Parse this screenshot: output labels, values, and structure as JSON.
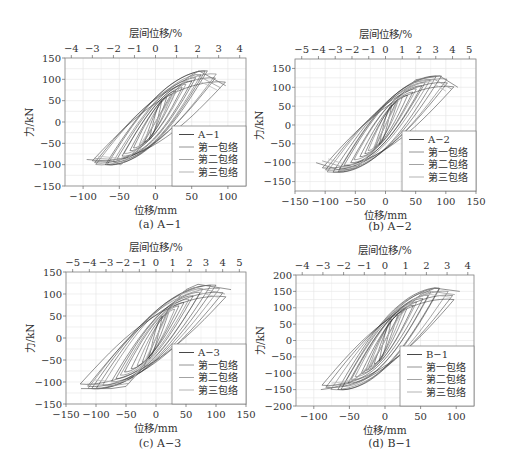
{
  "figure": {
    "panels": [
      {
        "id": "a",
        "caption": "(a) A−1",
        "top_axis_label": "层间位移/%",
        "bottom_axis_label": "位移/mm",
        "y_axis_label": "力/kN",
        "legend": [
          "A−1",
          "第一包络",
          "第二包络",
          "第三包络"
        ]
      },
      {
        "id": "b",
        "caption": "(b) A−2",
        "top_axis_label": "层间位移/%",
        "bottom_axis_label": "位移/mm",
        "y_axis_label": "力/kN",
        "legend": [
          "A−2",
          "第一包络",
          "第二包络",
          "第三包络"
        ]
      },
      {
        "id": "c",
        "caption": "(c) A−3",
        "top_axis_label": "层间位移/%",
        "bottom_axis_label": "位移/mm",
        "y_axis_label": "力/kN",
        "legend": [
          "A−3",
          "第一包络",
          "第二包络",
          "第三包络"
        ]
      },
      {
        "id": "d",
        "caption": "(d) B−1",
        "top_axis_label": "层间位移/%",
        "bottom_axis_label": "位移/mm",
        "y_axis_label": "力/kN",
        "legend": [
          "B−1",
          "第一包络",
          "第二包络",
          "第三包络"
        ]
      }
    ]
  },
  "chart_data": [
    {
      "type": "line",
      "title": "(a) A−1",
      "xlabel": "位移/mm",
      "x2label": "层间位移/%",
      "ylabel": "力/kN",
      "xlim": [
        -125,
        125
      ],
      "ylim": [
        -150,
        150
      ],
      "xticks": [
        -100,
        -50,
        0,
        50,
        100
      ],
      "x2ticks": [
        -4,
        -3,
        -2,
        -1,
        0,
        1,
        2,
        3,
        4
      ],
      "x2lim": [
        -4.3,
        4.3
      ],
      "yticks": [
        -150,
        -100,
        -50,
        0,
        50,
        100,
        150
      ],
      "grid": true,
      "legend_position": "lower right",
      "legend": [
        "A−1",
        "第一包络",
        "第二包络",
        "第三包络"
      ],
      "peaks": {
        "pos_disp": 97,
        "pos_force": 120,
        "neg_disp": -95,
        "neg_force": -100
      },
      "series": [
        {
          "name": "A−1",
          "style": "hysteresis",
          "color": "#222222"
        },
        {
          "name": "第一包络",
          "color": "#777777",
          "x": [
            -95,
            -60,
            -48,
            -20,
            0,
            20,
            45,
            60,
            97
          ],
          "y": [
            -88,
            -92,
            -100,
            -60,
            0,
            60,
            105,
            120,
            85
          ]
        },
        {
          "name": "第二包络",
          "color": "#999999",
          "x": [
            -85,
            -55,
            -45,
            -20,
            0,
            20,
            45,
            55,
            90
          ],
          "y": [
            -85,
            -88,
            -95,
            -55,
            0,
            55,
            100,
            112,
            80
          ]
        },
        {
          "name": "第三包络",
          "color": "#bbbbbb",
          "x": [
            -80,
            -50,
            -40,
            -20,
            0,
            20,
            40,
            50,
            85
          ],
          "y": [
            -80,
            -85,
            -90,
            -50,
            0,
            50,
            95,
            105,
            75
          ]
        }
      ]
    },
    {
      "type": "line",
      "title": "(b) A−2",
      "xlabel": "位移/mm",
      "x2label": "层间位移/%",
      "ylabel": "力/kN",
      "xlim": [
        -150,
        150
      ],
      "ylim": [
        -175,
        175
      ],
      "xticks": [
        -150,
        -100,
        -50,
        0,
        50,
        100,
        150
      ],
      "x2ticks": [
        -5,
        -4,
        -3,
        -2,
        -1,
        0,
        1,
        2,
        3,
        4,
        5
      ],
      "x2lim": [
        -5.4,
        5.4
      ],
      "yticks": [
        -150,
        -100,
        -50,
        0,
        50,
        100,
        150
      ],
      "grid": true,
      "legend_position": "lower right",
      "legend": [
        "A−2",
        "第一包络",
        "第二包络",
        "第三包络"
      ],
      "peaks": {
        "pos_disp": 120,
        "pos_force": 130,
        "neg_disp": -115,
        "neg_force": -125
      },
      "series": [
        {
          "name": "A−2",
          "style": "hysteresis",
          "color": "#222222"
        },
        {
          "name": "第一包络",
          "color": "#777777",
          "x": [
            -115,
            -75,
            -50,
            -20,
            0,
            20,
            50,
            90,
            120
          ],
          "y": [
            -100,
            -120,
            -115,
            -70,
            0,
            70,
            120,
            130,
            100
          ]
        },
        {
          "name": "第二包络",
          "color": "#999999",
          "x": [
            -105,
            -70,
            -45,
            -20,
            0,
            20,
            45,
            80,
            110
          ],
          "y": [
            -95,
            -112,
            -110,
            -65,
            0,
            65,
            112,
            122,
            95
          ]
        },
        {
          "name": "第三包络",
          "color": "#bbbbbb",
          "x": [
            -95,
            -65,
            -40,
            -20,
            0,
            20,
            40,
            75,
            100
          ],
          "y": [
            -90,
            -105,
            -103,
            -60,
            0,
            60,
            105,
            115,
            90
          ]
        }
      ]
    },
    {
      "type": "line",
      "title": "(c) A−3",
      "xlabel": "位移/mm",
      "x2label": "层间位移/%",
      "ylabel": "力/kN",
      "xlim": [
        -150,
        150
      ],
      "ylim": [
        -150,
        150
      ],
      "xticks": [
        -150,
        -100,
        -50,
        0,
        50,
        100,
        150
      ],
      "x2ticks": [
        -5,
        -4,
        -3,
        -2,
        -1,
        0,
        1,
        2,
        3,
        4,
        5
      ],
      "x2lim": [
        -5.4,
        5.4
      ],
      "yticks": [
        -150,
        -100,
        -50,
        0,
        50,
        100,
        150
      ],
      "grid": true,
      "legend_position": "lower right",
      "legend": [
        "A−3",
        "第一包络",
        "第二包络",
        "第三包络"
      ],
      "peaks": {
        "pos_disp": 125,
        "pos_force": 120,
        "neg_disp": -135,
        "neg_force": -115
      },
      "series": [
        {
          "name": "A−3",
          "style": "hysteresis",
          "color": "#222222"
        },
        {
          "name": "第一包络",
          "color": "#777777",
          "x": [
            -125,
            -75,
            -50,
            -20,
            0,
            20,
            50,
            70,
            125
          ],
          "y": [
            -115,
            -115,
            -110,
            -65,
            0,
            65,
            110,
            122,
            110
          ]
        },
        {
          "name": "第二包络",
          "color": "#999999",
          "x": [
            -115,
            -70,
            -45,
            -20,
            0,
            20,
            45,
            65,
            115
          ],
          "y": [
            -105,
            -108,
            -103,
            -60,
            0,
            60,
            105,
            115,
            100
          ]
        },
        {
          "name": "第三包络",
          "color": "#bbbbbb",
          "x": [
            -105,
            -65,
            -40,
            -20,
            0,
            20,
            40,
            60,
            105
          ],
          "y": [
            -95,
            -100,
            -95,
            -55,
            0,
            55,
            98,
            108,
            92
          ]
        }
      ]
    },
    {
      "type": "line",
      "title": "(d) B−1",
      "xlabel": "位移/mm",
      "x2label": "层间位移/%",
      "ylabel": "力/kN",
      "xlim": [
        -125,
        125
      ],
      "ylim": [
        -200,
        200
      ],
      "xticks": [
        -100,
        -50,
        0,
        50,
        100
      ],
      "x2ticks": [
        -4,
        -3,
        -2,
        -1,
        0,
        1,
        2,
        3,
        4
      ],
      "x2lim": [
        -4.3,
        4.3
      ],
      "yticks": [
        -200,
        -150,
        -100,
        -50,
        0,
        50,
        100,
        150,
        200
      ],
      "grid": true,
      "legend_position": "lower right",
      "legend": [
        "B−1",
        "第一包络",
        "第二包络",
        "第三包络"
      ],
      "peaks": {
        "pos_disp": 105,
        "pos_force": 160,
        "neg_disp": -90,
        "neg_force": -150
      },
      "series": [
        {
          "name": "B−1",
          "style": "hysteresis",
          "color": "#222222"
        },
        {
          "name": "第一包络",
          "color": "#777777",
          "x": [
            -90,
            -75,
            -50,
            -20,
            0,
            20,
            50,
            70,
            105
          ],
          "y": [
            -150,
            -145,
            -130,
            -80,
            0,
            80,
            140,
            160,
            150
          ]
        },
        {
          "name": "第二包络",
          "color": "#999999",
          "x": [
            -82,
            -68,
            -45,
            -20,
            0,
            20,
            45,
            65,
            98
          ],
          "y": [
            -140,
            -135,
            -122,
            -75,
            0,
            75,
            132,
            150,
            140
          ]
        },
        {
          "name": "第三包络",
          "color": "#bbbbbb",
          "x": [
            -75,
            -62,
            -40,
            -20,
            0,
            20,
            40,
            60,
            92
          ],
          "y": [
            -130,
            -127,
            -115,
            -70,
            0,
            70,
            125,
            142,
            132
          ]
        }
      ]
    }
  ],
  "layout": {
    "frames": [
      {
        "left": 65,
        "top": 58,
        "right": 246,
        "bottom": 186
      },
      {
        "left": 295,
        "top": 59,
        "right": 476,
        "bottom": 191
      },
      {
        "left": 66,
        "top": 272,
        "right": 246,
        "bottom": 404
      },
      {
        "left": 296,
        "top": 275,
        "right": 474,
        "bottom": 406
      }
    ]
  }
}
